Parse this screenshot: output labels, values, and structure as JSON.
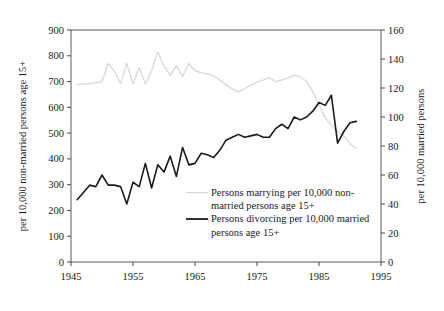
{
  "chart_data": {
    "type": "line",
    "title": "",
    "xlabel": "",
    "ylabel": "per 10,000 non-married persons age 15+",
    "y2label": "per 10,000 married persons",
    "xlim": [
      1945,
      1995
    ],
    "ylim": [
      0,
      900
    ],
    "y2lim": [
      0,
      160
    ],
    "grid": false,
    "legend_position": "inside-center-right",
    "xticks": [
      "1945",
      "1955",
      "1965",
      "1975",
      "1985",
      "1995"
    ],
    "xtick_values": [
      1945,
      1955,
      1965,
      1975,
      1985,
      1995
    ],
    "yticks": [
      "0",
      "100",
      "200",
      "300",
      "400",
      "500",
      "600",
      "700",
      "800",
      "900"
    ],
    "ytick_values": [
      0,
      100,
      200,
      300,
      400,
      500,
      600,
      700,
      800,
      900
    ],
    "y2ticks": [
      "0",
      "20",
      "40",
      "60",
      "80",
      "100",
      "120",
      "140",
      "160"
    ],
    "y2tick_values": [
      0,
      20,
      40,
      60,
      80,
      100,
      120,
      140,
      160
    ],
    "series": [
      {
        "name": "Persons marrying per 10,000 non-married persons age 15+",
        "axis": "left",
        "color": "#d8d8d8",
        "width": 1.3,
        "x": [
          1946,
          1947,
          1948,
          1949,
          1950,
          1951,
          1952,
          1953,
          1954,
          1955,
          1956,
          1957,
          1958,
          1959,
          1960,
          1961,
          1962,
          1963,
          1964,
          1965,
          1966,
          1967,
          1968,
          1969,
          1970,
          1971,
          1972,
          1973,
          1974,
          1975,
          1976,
          1977,
          1978,
          1979,
          1980,
          1981,
          1982,
          1983,
          1984,
          1985,
          1986,
          1987,
          1988,
          1989,
          1990,
          1991
        ],
        "values": [
          688,
          690,
          692,
          695,
          700,
          770,
          740,
          692,
          770,
          690,
          755,
          690,
          742,
          815,
          760,
          725,
          762,
          720,
          770,
          742,
          735,
          730,
          722,
          706,
          688,
          672,
          660,
          672,
          686,
          698,
          706,
          714,
          700,
          706,
          714,
          724,
          718,
          700,
          660,
          612,
          560,
          530,
          505,
          488,
          460,
          440
        ]
      },
      {
        "name": "Persons divorcing per 10,000 married persons age 15+",
        "axis": "right",
        "color": "#1a1a1a",
        "width": 1.6,
        "x": [
          1946,
          1947,
          1948,
          1949,
          1950,
          1951,
          1952,
          1953,
          1954,
          1955,
          1956,
          1957,
          1958,
          1959,
          1960,
          1961,
          1962,
          1963,
          1964,
          1965,
          1966,
          1967,
          1968,
          1969,
          1970,
          1971,
          1972,
          1973,
          1974,
          1975,
          1976,
          1977,
          1978,
          1979,
          1980,
          1981,
          1982,
          1983,
          1984,
          1985,
          1986,
          1987,
          1988,
          1989,
          1990,
          1991
        ],
        "values": [
          43,
          48,
          53,
          52,
          60,
          53,
          53,
          52,
          40,
          55,
          52,
          68,
          51,
          67,
          62,
          73,
          59,
          79,
          67,
          68,
          75,
          74,
          72,
          77,
          84,
          86,
          88,
          86,
          87,
          88,
          86,
          86,
          92,
          95,
          92,
          100,
          98,
          100,
          104,
          110,
          108,
          115,
          82,
          90,
          96,
          97
        ]
      }
    ],
    "legend": [
      {
        "label_lines": [
          "Persons marrying per 10,000 non-",
          "married persons age 15+"
        ],
        "color": "#d8d8d8"
      },
      {
        "label_lines": [
          "Persons divorcing per 10,000 married",
          "persons age 15+"
        ],
        "color": "#1a1a1a"
      }
    ]
  }
}
